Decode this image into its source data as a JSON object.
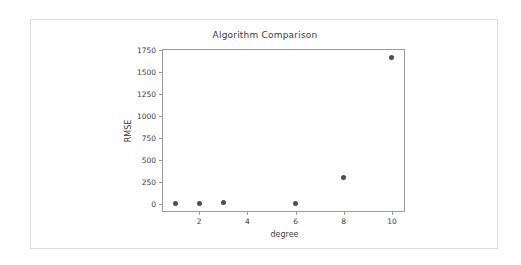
{
  "figure": {
    "background_color": "#ffffff",
    "frame_color": "#dcdcdc",
    "axis_color": "#9a9a9a",
    "marker_color": "#4d4d4d",
    "text_color": "#3b3b3b"
  },
  "chart_data": {
    "type": "scatter",
    "title": "Algorithm Comparison",
    "xlabel": "degree",
    "ylabel": "RMSE",
    "x": [
      1,
      2,
      3,
      6,
      8,
      10
    ],
    "y": [
      3,
      5,
      12,
      5,
      300,
      1670
    ],
    "points": [
      {
        "x": 1,
        "y": 3
      },
      {
        "x": 2,
        "y": 5
      },
      {
        "x": 3,
        "y": 12
      },
      {
        "x": 6,
        "y": 5
      },
      {
        "x": 8,
        "y": 300
      },
      {
        "x": 10,
        "y": 1670
      }
    ],
    "xlim": [
      0.5,
      10.5
    ],
    "ylim": [
      -85,
      1750
    ],
    "xticks": [
      2,
      4,
      6,
      8,
      10
    ],
    "xtick_labels": [
      "2",
      "4",
      "6",
      "8",
      "10"
    ],
    "yticks": [
      0,
      250,
      500,
      750,
      1000,
      1250,
      1500,
      1750
    ],
    "ytick_labels": [
      "0",
      "250",
      "500",
      "750",
      "1000",
      "1250",
      "1500",
      "1750"
    ],
    "grid": false,
    "legend": null,
    "marker": "circle",
    "series": [
      {
        "name": "RMSE",
        "values": [
          3,
          5,
          12,
          5,
          300,
          1670
        ]
      }
    ]
  }
}
